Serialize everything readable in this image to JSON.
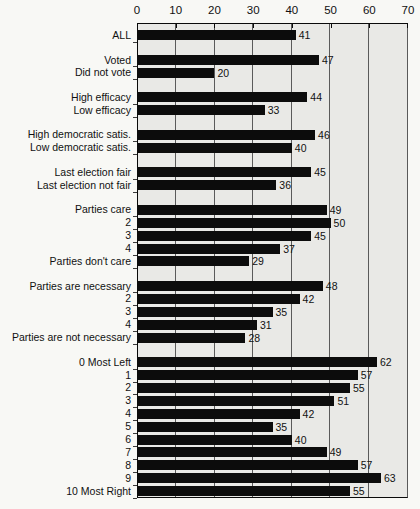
{
  "colors": {
    "bar": "#0c0c0c",
    "plot_background": "#e9e9e6",
    "gridline": "#5a5a5a",
    "axis": "#0a0a0a",
    "page_background": "#f8f8f5",
    "text": "#111111"
  },
  "chart_data": {
    "type": "bar",
    "orientation": "horizontal",
    "title": "",
    "xlabel": "",
    "ylabel": "",
    "xlim": [
      0,
      70
    ],
    "x_ticks": [
      0,
      10,
      20,
      30,
      40,
      50,
      60,
      70
    ],
    "grid": true,
    "axis_position": "top",
    "groups": [
      {
        "rows": [
          {
            "label": "ALL",
            "value": 41
          }
        ]
      },
      {
        "rows": [
          {
            "label": "Voted",
            "value": 47
          },
          {
            "label": "Did not vote",
            "value": 20
          }
        ]
      },
      {
        "rows": [
          {
            "label": "High efficacy",
            "value": 44
          },
          {
            "label": "Low efficacy",
            "value": 33
          }
        ]
      },
      {
        "rows": [
          {
            "label": "High democratic satis.",
            "value": 46
          },
          {
            "label": "Low democratic satis.",
            "value": 40
          }
        ]
      },
      {
        "rows": [
          {
            "label": "Last election fair",
            "value": 45
          },
          {
            "label": "Last election not fair",
            "value": 36
          }
        ]
      },
      {
        "rows": [
          {
            "label": "Parties care",
            "value": 49
          },
          {
            "label": "2",
            "value": 50
          },
          {
            "label": "3",
            "value": 45
          },
          {
            "label": "4",
            "value": 37
          },
          {
            "label": "Parties don't care",
            "value": 29
          }
        ]
      },
      {
        "rows": [
          {
            "label": "Parties are necessary",
            "value": 48
          },
          {
            "label": "2",
            "value": 42
          },
          {
            "label": "3",
            "value": 35
          },
          {
            "label": "4",
            "value": 31
          },
          {
            "label": "Parties are not necessary",
            "value": 28
          }
        ]
      },
      {
        "rows": [
          {
            "label": "0 Most Left",
            "value": 62
          },
          {
            "label": "1",
            "value": 57
          },
          {
            "label": "2",
            "value": 55
          },
          {
            "label": "3",
            "value": 51
          },
          {
            "label": "4",
            "value": 42
          },
          {
            "label": "5",
            "value": 35
          },
          {
            "label": "6",
            "value": 40
          },
          {
            "label": "7",
            "value": 49
          },
          {
            "label": "8",
            "value": 57
          },
          {
            "label": "9",
            "value": 63
          },
          {
            "label": "10 Most Right",
            "value": 55
          }
        ]
      }
    ]
  }
}
